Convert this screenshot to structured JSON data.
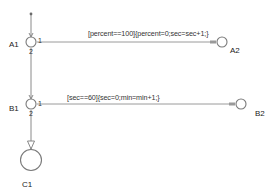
{
  "diagram": {
    "type": "stateflow-flow-chart",
    "colors": {
      "line": "#8a8a8a",
      "node_stroke": "#7a7a7a",
      "text": "#222222",
      "background": "#ffffff"
    },
    "nodes": {
      "A1": {
        "label": "A1",
        "port_right": "1",
        "port_bottom": "2"
      },
      "A2": {
        "label": "A2"
      },
      "B1": {
        "label": "B1",
        "port_right": "1",
        "port_bottom": "2"
      },
      "B2": {
        "label": "B2"
      },
      "C1": {
        "label": "C1"
      }
    },
    "transitions": [
      {
        "from": "A1",
        "to": "A2",
        "order": "1",
        "label": "[percent==100]{percent=0;sec=sec+1;}"
      },
      {
        "from": "A1",
        "to": "B1",
        "order": "2",
        "label": ""
      },
      {
        "from": "B1",
        "to": "B2",
        "order": "1",
        "label": "[sec==60]{sec=0;min=min+1;}"
      },
      {
        "from": "B1",
        "to": "C1",
        "order": "2",
        "label": ""
      }
    ]
  }
}
